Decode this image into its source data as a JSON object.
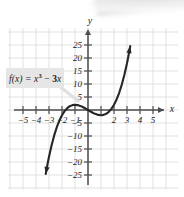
{
  "figure": {
    "type": "cartesian-graph",
    "background": "#ffffff",
    "grid_color": "#d9d9d9",
    "axis_color": "#4d4d4d",
    "curve_color": "#262626"
  },
  "labels": {
    "x_axis": "x",
    "y_axis": "y",
    "function_label": "f(x) = x",
    "function_exponent": "3",
    "function_minus": " − ",
    "function_tail": "3",
    "function_var": "x"
  },
  "chart_data": {
    "type": "line",
    "title": "",
    "subtitle": "",
    "xlabel": "x",
    "ylabel": "y",
    "equation": "f(x) = x^3 - 3x",
    "annotations": [
      "f(x) = x³ − 3x"
    ],
    "grid": true,
    "legend_position": "none",
    "xlim": [
      -6,
      6
    ],
    "ylim": [
      -30,
      30
    ],
    "xticks": [
      -5,
      -4,
      -3,
      -2,
      -1,
      1,
      2,
      3,
      4,
      5
    ],
    "xtick_labels": [
      "−5",
      "−4",
      "−3",
      "−2",
      "−1",
      "",
      "2",
      "3",
      "4",
      "5"
    ],
    "yticks": [
      25,
      20,
      15,
      10,
      5,
      -5,
      -10,
      -15,
      -20,
      -25
    ],
    "ytick_labels": [
      "25",
      "20",
      "15",
      "10",
      "5",
      "−5",
      "−10",
      "−15",
      "−20",
      "−25"
    ],
    "x_minor_step": 1,
    "y_minor_step": 5,
    "series": [
      {
        "name": "f(x) = x³ − 3x",
        "x": [
          -3.25,
          -3.1,
          -3.0,
          -2.8,
          -2.6,
          -2.4,
          -2.2,
          -2.0,
          -1.8,
          -1.6,
          -1.4,
          -1.2,
          -1.0,
          -0.8,
          -0.6,
          -0.4,
          -0.2,
          0.0,
          0.2,
          0.4,
          0.6,
          0.8,
          1.0,
          1.2,
          1.4,
          1.6,
          1.8,
          2.0,
          2.2,
          2.4,
          2.6,
          2.8,
          3.0,
          3.1,
          3.25
        ],
        "y": [
          -24.57,
          -20.5,
          -18.0,
          -13.55,
          -9.78,
          -6.62,
          -4.05,
          -2.0,
          -0.43,
          0.7,
          1.46,
          1.87,
          2.0,
          1.89,
          1.58,
          1.14,
          0.59,
          0.0,
          -0.59,
          -1.14,
          -1.58,
          -1.89,
          -2.0,
          -1.87,
          -1.46,
          -0.7,
          0.43,
          2.0,
          4.05,
          6.62,
          9.78,
          13.55,
          18.0,
          20.5,
          24.57
        ],
        "arrow_start": true,
        "arrow_end": true
      }
    ],
    "key_points": {
      "local_maximum": {
        "x": -1,
        "y": 2
      },
      "local_minimum": {
        "x": 1,
        "y": -2
      },
      "x_intercepts": [
        -1.732,
        0,
        1.732
      ],
      "y_intercept": 0
    }
  }
}
